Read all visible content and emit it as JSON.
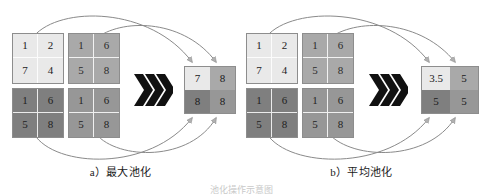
{
  "figure": {
    "title": "池化操作示意图",
    "panels": [
      {
        "id": "a",
        "caption": "a）最大池化",
        "input": {
          "quadrants": [
            {
              "name": "top-left",
              "shade": "#e9e9e9",
              "values": [
                "1",
                "2",
                "7",
                "4"
              ]
            },
            {
              "name": "top-right",
              "shade": "#a9a9a9",
              "values": [
                "1",
                "6",
                "5",
                "8"
              ]
            },
            {
              "name": "bottom-left",
              "shade": "#7f7f7f",
              "values": [
                "1",
                "6",
                "5",
                "8"
              ]
            },
            {
              "name": "bottom-right",
              "shade": "#979797",
              "values": [
                "1",
                "6",
                "5",
                "8"
              ]
            }
          ]
        },
        "arrow_symbol": "»",
        "output": {
          "cells": [
            {
              "name": "top-left",
              "shade": "#e9e9e9",
              "value": "7"
            },
            {
              "name": "top-right",
              "shade": "#a9a9a9",
              "value": "8"
            },
            {
              "name": "bottom-left",
              "shade": "#7f7f7f",
              "value": "8"
            },
            {
              "name": "bottom-right",
              "shade": "#979797",
              "value": "8"
            }
          ]
        }
      },
      {
        "id": "b",
        "caption": "b）平均池化",
        "input": {
          "quadrants": [
            {
              "name": "top-left",
              "shade": "#e9e9e9",
              "values": [
                "1",
                "2",
                "7",
                "4"
              ]
            },
            {
              "name": "top-right",
              "shade": "#a9a9a9",
              "values": [
                "1",
                "6",
                "5",
                "8"
              ]
            },
            {
              "name": "bottom-left",
              "shade": "#7f7f7f",
              "values": [
                "1",
                "6",
                "5",
                "8"
              ]
            },
            {
              "name": "bottom-right",
              "shade": "#979797",
              "values": [
                "1",
                "6",
                "5",
                "8"
              ]
            }
          ]
        },
        "arrow_symbol": "»",
        "output": {
          "cells": [
            {
              "name": "top-left",
              "shade": "#e9e9e9",
              "value": "3.5"
            },
            {
              "name": "top-right",
              "shade": "#a9a9a9",
              "value": "5"
            },
            {
              "name": "bottom-left",
              "shade": "#7f7f7f",
              "value": "5"
            },
            {
              "name": "bottom-right",
              "shade": "#979797",
              "value": "5"
            }
          ]
        }
      }
    ],
    "colors": {
      "arrow_stroke": "#8a8a8a",
      "grid_border": "#8d8d8d",
      "chevron_fill": "#111111",
      "text": "#1a1a1a"
    }
  }
}
